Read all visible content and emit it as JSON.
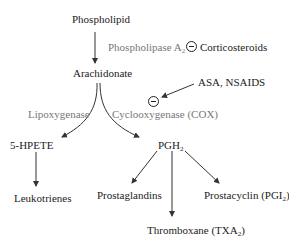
{
  "nodes": {
    "phospholipid": "Phospholipid",
    "arachidonate": "Arachidonate",
    "hpete": "5-HPETE",
    "pgh2": {
      "base": "PGH",
      "sub": "2"
    },
    "leukotrienes": "Leukotrienes",
    "prostaglandins": "Prostaglandins",
    "thromboxane": {
      "base": "Thromboxane (TXA",
      "sub": "2",
      "tail": ")"
    },
    "prostacyclin": {
      "base": "Prostacyclin (PGI",
      "sub": "2",
      "tail": ")"
    }
  },
  "enzymes": {
    "phospholipase": {
      "base": "Phospholipase A",
      "sub": "2"
    },
    "lipoxygenase": "Lipoxygenase",
    "cox": "Cyclooxygenase (COX)"
  },
  "inhibitors": {
    "corticosteroids": "Corticosteroids",
    "nsaids": "ASA, NSAIDS",
    "inhibit_symbol": "minus-in-circle"
  },
  "colors": {
    "compound_text": "#222222",
    "enzyme_text": "#777777",
    "arrow": "#333333"
  }
}
